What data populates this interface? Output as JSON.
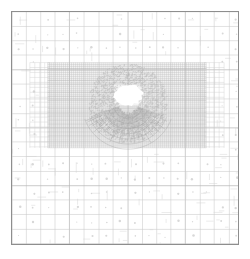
{
  "figure": {
    "title": "",
    "background_color": "#ffffff",
    "width_px": 250,
    "height_px": 259
  },
  "plot_frame": {
    "name": "mesh-plot-frame",
    "border_color": "#8e8e8e",
    "border_width_px": 1,
    "x_px": 11,
    "y_px": 11,
    "width_px": 228,
    "height_px": 234,
    "fill_color": "#ffffff"
  },
  "chart_data": {
    "type": "heatmap",
    "title": "",
    "subtitle": "",
    "xlabel": "",
    "ylabel": "",
    "xlim": [
      0,
      228
    ],
    "ylim": [
      0,
      234
    ],
    "grid": true,
    "legend": null,
    "annotations": [],
    "regions": [
      {
        "name": "coarse-background-mesh",
        "level": 0,
        "x": 0,
        "y": 0,
        "width": 228,
        "height": 234,
        "cell_size_px": 14.6,
        "columns": 16,
        "rows": 16,
        "line_color": "#c9c9c9",
        "marker_color": "#d8d8d8",
        "has_cell_markers": true
      },
      {
        "name": "refined-band",
        "level": 2,
        "x": 36,
        "y": 51,
        "width": 160,
        "height": 86,
        "cell_size_px": 2.0,
        "columns": 80,
        "rows": 43,
        "line_color": "#bdbdbd",
        "tint_color": "#f3f3f3",
        "has_cell_markers": false
      },
      {
        "name": "transition-zone-left",
        "level": 1,
        "x": 18,
        "y": 51,
        "width": 20,
        "height": 86,
        "cell_size_px": 5.0,
        "line_color": "#d2d2d2"
      },
      {
        "name": "transition-zone-right",
        "level": 1,
        "x": 194,
        "y": 51,
        "width": 20,
        "height": 86,
        "cell_size_px": 5.0,
        "line_color": "#d2d2d2"
      },
      {
        "name": "central-void",
        "level": 3,
        "x": 103,
        "y": 73,
        "width": 29,
        "height": 21,
        "fill_color": "#ffffff",
        "note": "unmeshed bright core at centre of refined band"
      },
      {
        "name": "radial-fan",
        "level": 3,
        "center_x": 117,
        "center_y": 92,
        "radius_px": 46,
        "angle_start_deg": 200,
        "angle_end_deg": 340,
        "ray_count": 56,
        "line_color": "#9a9a9a",
        "note": "fan of fine radial cells spreading downward from the void"
      }
    ],
    "palette": {
      "frame": "#8e8e8e",
      "coarse_mesh": "#c9c9c9",
      "mid_mesh": "#d2d2d2",
      "fine_mesh": "#bdbdbd",
      "finest_mesh": "#aaaaaa",
      "radial": "#9a9a9a",
      "band_tint": "#f3f3f3",
      "background": "#ffffff"
    }
  }
}
